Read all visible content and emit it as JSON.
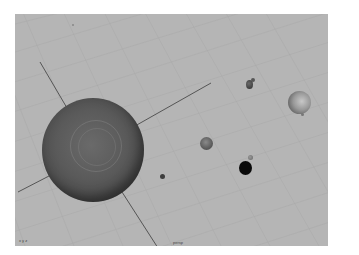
{
  "viewport": {
    "background_color": "#b5b5b5",
    "camera_label": "persp",
    "axis_gizmo_label": "x y z"
  },
  "objects": [
    {
      "name": "sun",
      "color": "#555555"
    },
    {
      "name": "planet-small-upper",
      "color": "#4a4a4a"
    },
    {
      "name": "planet-ringed",
      "color": "#8a8a8a"
    },
    {
      "name": "planet-medium",
      "color": "#6a6a6a"
    },
    {
      "name": "planet-tiny",
      "color": "#777777"
    },
    {
      "name": "planet-black",
      "color": "#0a0a0a"
    },
    {
      "name": "planet-dot-left",
      "color": "#444444"
    }
  ]
}
